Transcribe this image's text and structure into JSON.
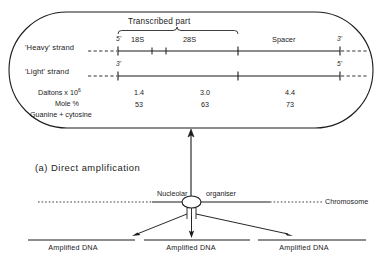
{
  "figure": {
    "caption": "(a)  Direct amplification"
  },
  "capsule": {
    "transcribed_label": "Transcribed part",
    "strands": [
      {
        "name": "heavy",
        "label": "'Heavy' strand",
        "left_prime": "5'",
        "right_prime": "3'"
      },
      {
        "name": "light",
        "label": "'Light' strand",
        "left_prime": "3'",
        "right_prime": "5'"
      }
    ],
    "regions": [
      {
        "label": "18S"
      },
      {
        "label": "28S"
      },
      {
        "label": "Spacer"
      }
    ],
    "table": {
      "row_labels": {
        "daltons": "Daltons x 10",
        "daltons_exponent": "6",
        "mole": "Mole %",
        "gc": "Guanine + cytosine"
      },
      "daltons_values": [
        "1.4",
        "3.0",
        "4.4"
      ],
      "mole_values": [
        "53",
        "63",
        "73"
      ]
    }
  },
  "chromosome_diagram": {
    "nucleolar_label": "Nucleolar",
    "organiser_label": "organiser",
    "chromosome_label": "Chromosome",
    "amplified_labels": [
      "Amplified DNA",
      "Amplified DNA",
      "Amplified DNA"
    ]
  },
  "colors": {
    "ink": "#1b1b1b",
    "background": "#ffffff"
  }
}
